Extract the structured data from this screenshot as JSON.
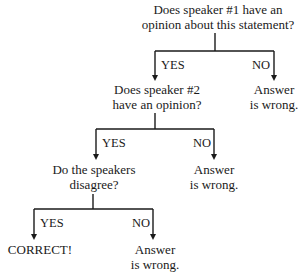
{
  "diagram": {
    "type": "decision-tree",
    "nodes": {
      "q1": {
        "line1": "Does speaker #1 have an",
        "line2": "opinion about this statement?"
      },
      "q2": {
        "line1": "Does speaker #2",
        "line2": "have an opinion?"
      },
      "q3": {
        "line1": "Do the speakers",
        "line2": "disagree?"
      },
      "wrong1": {
        "line1": "Answer",
        "line2": "is wrong."
      },
      "wrong2": {
        "line1": "Answer",
        "line2": "is wrong."
      },
      "wrong3": {
        "line1": "Answer",
        "line2": "is wrong."
      },
      "correct": {
        "line1": "CORRECT!"
      }
    },
    "edges": [
      {
        "from": "q1",
        "to": "q2",
        "label": "YES"
      },
      {
        "from": "q1",
        "to": "wrong1",
        "label": "NO"
      },
      {
        "from": "q2",
        "to": "q3",
        "label": "YES"
      },
      {
        "from": "q2",
        "to": "wrong2",
        "label": "NO"
      },
      {
        "from": "q3",
        "to": "correct",
        "label": "YES"
      },
      {
        "from": "q3",
        "to": "wrong3",
        "label": "NO"
      }
    ]
  }
}
